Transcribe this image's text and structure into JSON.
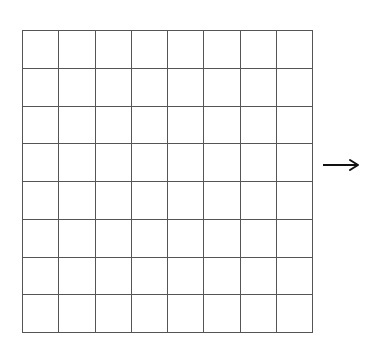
{
  "diagram": {
    "type": "grid",
    "rows": 8,
    "cols": 8,
    "bounds": {
      "x": 22,
      "y": 30,
      "width": 290,
      "height": 302
    },
    "line_color": "#555555",
    "line_width": 1,
    "background": "#ffffff"
  },
  "arrow": {
    "direction": "right",
    "x1": 323,
    "x2": 358,
    "y": 165,
    "color": "#111111"
  }
}
